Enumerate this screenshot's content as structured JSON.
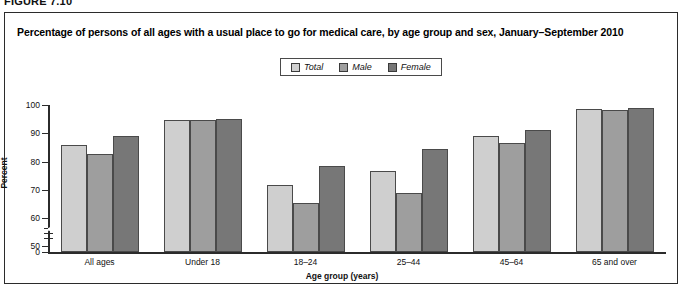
{
  "figure_label": "FIGURE 7.10",
  "chart_data": {
    "type": "bar",
    "title": "Percentage of persons of all ages with a usual place to go for medical care, by age group and sex, January–September 2010",
    "xlabel": "Age group (years)",
    "ylabel": "Percent",
    "ylim": [
      50,
      100
    ],
    "y_axis_break": true,
    "y_ticks": [
      "0",
      "50",
      "60",
      "70",
      "80",
      "90",
      "100"
    ],
    "grid": false,
    "legend_position": "top-center",
    "categories": [
      "All ages",
      "Under 18",
      "18–24",
      "25–44",
      "45–64",
      "65 and over"
    ],
    "series": [
      {
        "name": "Total",
        "color": "#cfcfcf",
        "values": [
          85.8,
          94.7,
          71.7,
          76.8,
          89.0,
          98.6
        ]
      },
      {
        "name": "Male",
        "color": "#9e9e9e",
        "values": [
          82.5,
          94.6,
          65.2,
          68.8,
          86.7,
          98.4
        ]
      },
      {
        "name": "Female",
        "color": "#777777",
        "values": [
          89.2,
          95.2,
          78.3,
          84.6,
          91.3,
          98.9
        ]
      }
    ]
  },
  "legend": {
    "items": [
      {
        "label": "Total",
        "swatch": "#cfcfcf"
      },
      {
        "label": "Male",
        "swatch": "#9e9e9e"
      },
      {
        "label": "Female",
        "swatch": "#777777"
      }
    ]
  }
}
